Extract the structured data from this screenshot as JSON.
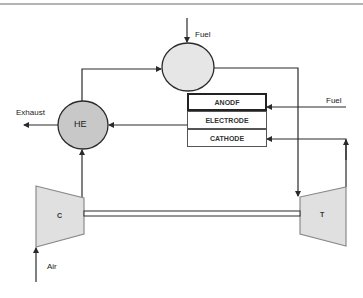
{
  "diagram": {
    "type": "process-flow",
    "title": "",
    "components": {
      "combustor": {
        "label": ""
      },
      "heat_exchanger": {
        "label": "HE"
      },
      "compressor": {
        "label": "C"
      },
      "turbine": {
        "label": "T"
      },
      "fuel_cell": {
        "layers": [
          {
            "id": "anode",
            "label": "ANODF"
          },
          {
            "id": "electrode",
            "label": "ELECTRODE"
          },
          {
            "id": "cathode",
            "label": "CATHODE"
          }
        ]
      }
    },
    "stream_labels": {
      "fuel_top": "Fuel",
      "fuel_right": "Fuel",
      "exhaust": "Exhaust",
      "air": "Air"
    },
    "colors": {
      "line": "#2a2a2a",
      "he_fill": "#c8c8c8",
      "combustor_fill": "#e6e6e6",
      "machine_fill": "#e0e0e0",
      "machine_stroke": "#8a8a8a",
      "top_rule": "#9a9a9a"
    }
  }
}
